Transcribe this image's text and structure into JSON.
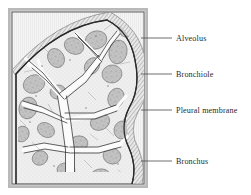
{
  "figure": {
    "name": "lung-cross-section-diagram",
    "style": "engraved line drawing, grayscale"
  },
  "palette": {
    "page_background": "#ffffff",
    "frame_outer": "#b9b9b9",
    "frame_inner_line": "#555555",
    "plate_background": "#f2f2f2",
    "lung_fill": "#ededed",
    "lung_outline": "#3a3a3a",
    "pleura_band": "#dcdcdc",
    "alveoli_fill": "#b4b4b4",
    "airway_fill": "#fbfbfb",
    "leader_line": "#4a4a4a",
    "label_text": "#2a2a2a"
  },
  "frame": {
    "outer_x": 8,
    "outer_y": 8,
    "outer_width": 140,
    "outer_height": 180,
    "band_thickness": 4
  },
  "labels": [
    {
      "id": "alveolus",
      "text": "Alveolus",
      "text_x": 176,
      "text_y": 41,
      "leader_x1": 141,
      "leader_y1": 38,
      "leader_x2": 172,
      "leader_y2": 38,
      "target_structure": "alveolar sac cluster"
    },
    {
      "id": "bronchiole",
      "text": "Bronchiole",
      "text_x": 176,
      "text_y": 77,
      "leader_x1": 141,
      "leader_y1": 74,
      "leader_x2": 172,
      "leader_y2": 74,
      "target_structure": "small airway branch"
    },
    {
      "id": "pleural-membrane",
      "text": "Pleural membrane",
      "text_x": 176,
      "text_y": 113,
      "leader_x1": 141,
      "leader_y1": 110,
      "leader_x2": 172,
      "leader_y2": 110,
      "target_structure": "outer lining of lung"
    },
    {
      "id": "bronchus",
      "text": "Bronchus",
      "text_x": 176,
      "text_y": 164,
      "leader_x1": 141,
      "leader_y1": 161,
      "leader_x2": 172,
      "leader_y2": 161,
      "target_structure": "main airway trunk"
    }
  ]
}
